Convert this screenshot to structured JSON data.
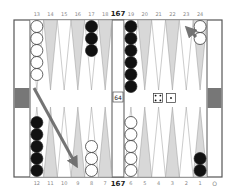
{
  "board": {
    "pip_top": "167",
    "pip_bottom": "167",
    "cube_value": "64",
    "off_indicator": "O",
    "dice": [
      4,
      1
    ],
    "colors": {
      "frame": "#555555",
      "dark_point": "#d8d8d8",
      "light_point": "#ffffff",
      "tray_block": "#777777",
      "arrow": "#666666",
      "black_checker": "#111111",
      "white_checker": "#ffffff"
    },
    "top_labels": [
      "13",
      "14",
      "15",
      "16",
      "17",
      "18",
      "19",
      "20",
      "21",
      "22",
      "23",
      "24"
    ],
    "bottom_labels": [
      "12",
      "11",
      "10",
      "9",
      "8",
      "7",
      "6",
      "5",
      "4",
      "3",
      "2",
      "1"
    ],
    "points": [
      {
        "point": 13,
        "color": "white",
        "count": 5
      },
      {
        "point": 17,
        "color": "black",
        "count": 3
      },
      {
        "point": 19,
        "color": "black",
        "count": 6
      },
      {
        "point": 24,
        "color": "white",
        "count": 2
      },
      {
        "point": 12,
        "color": "black",
        "count": 5
      },
      {
        "point": 8,
        "color": "white",
        "count": 3
      },
      {
        "point": 6,
        "color": "white",
        "count": 5
      },
      {
        "point": 1,
        "color": "black",
        "count": 2
      }
    ],
    "arrows": [
      {
        "from": "13",
        "to": "9",
        "desc": "long diagonal move arrow"
      },
      {
        "from": "24",
        "to": "23",
        "desc": "short move arrow"
      }
    ]
  }
}
